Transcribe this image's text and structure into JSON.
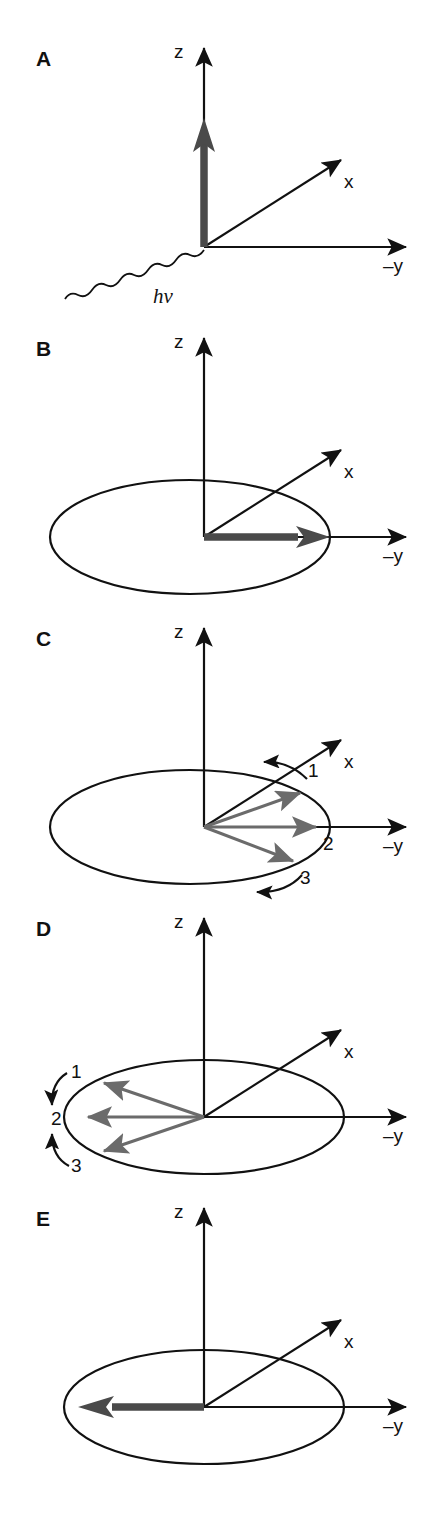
{
  "figure": {
    "type": "scientific-vector-diagram",
    "background_color": "#ffffff",
    "axis_color": "#111111",
    "bold_vector_color": "#4a4a4a",
    "gray_vector_color": "#6b6b6b"
  },
  "panels": [
    {
      "letter": "A",
      "axes": {
        "z": "z",
        "x": "x",
        "y": "–y"
      },
      "has_ellipse": false,
      "photon_label": "hv",
      "bold_vector": {
        "direction": "z",
        "present": true
      },
      "numbered_vectors": [],
      "curved_arrows": []
    },
    {
      "letter": "B",
      "axes": {
        "z": "z",
        "x": "x",
        "y": "–y"
      },
      "has_ellipse": true,
      "photon_label": null,
      "bold_vector": {
        "direction": "-y",
        "present": true
      },
      "numbered_vectors": [],
      "curved_arrows": []
    },
    {
      "letter": "C",
      "axes": {
        "z": "z",
        "x": "x",
        "y": "–y"
      },
      "has_ellipse": true,
      "photon_label": null,
      "bold_vector": {
        "direction": null,
        "present": false
      },
      "numbered_vectors": [
        {
          "label": "1",
          "angle_deg": 20
        },
        {
          "label": "2",
          "angle_deg": 0
        },
        {
          "label": "3",
          "angle_deg": -20
        }
      ],
      "curved_arrows": [
        "top-counterclockwise",
        "bottom-counterclockwise"
      ]
    },
    {
      "letter": "D",
      "axes": {
        "z": "z",
        "x": "x",
        "y": "–y"
      },
      "has_ellipse": true,
      "photon_label": null,
      "bold_vector": {
        "direction": null,
        "present": false
      },
      "numbered_vectors": [
        {
          "label": "1",
          "angle_deg": 160
        },
        {
          "label": "2",
          "angle_deg": 180
        },
        {
          "label": "3",
          "angle_deg": 200
        }
      ],
      "curved_arrows": [
        "upper-down",
        "lower-up"
      ]
    },
    {
      "letter": "E",
      "axes": {
        "z": "z",
        "x": "x",
        "y": "–y"
      },
      "has_ellipse": true,
      "photon_label": null,
      "bold_vector": {
        "direction": "+y",
        "present": true
      },
      "numbered_vectors": [],
      "curved_arrows": []
    }
  ],
  "labels": {
    "z": "z",
    "x": "x",
    "minus_y": "–y",
    "hv": "hv",
    "one": "1",
    "two": "2",
    "three": "3",
    "A": "A",
    "B": "B",
    "C": "C",
    "D": "D",
    "E": "E"
  }
}
